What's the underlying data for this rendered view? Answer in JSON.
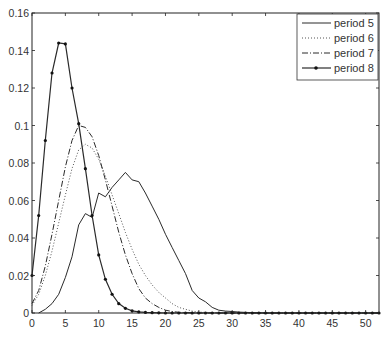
{
  "chart_data": {
    "type": "line",
    "title": "",
    "xlabel": "",
    "ylabel": "",
    "xlim": [
      0,
      52
    ],
    "ylim": [
      0,
      0.16
    ],
    "grid": false,
    "legend_position": "upper right",
    "x_ticks": [
      0,
      5,
      10,
      15,
      20,
      25,
      30,
      35,
      40,
      45,
      50
    ],
    "x_tick_labels": [
      "0",
      "5",
      "10",
      "15",
      "20",
      "25",
      "30",
      "35",
      "40",
      "45",
      "50"
    ],
    "y_ticks": [
      0,
      0.02,
      0.04,
      0.06,
      0.08,
      0.1,
      0.12,
      0.14,
      0.16
    ],
    "y_tick_labels": [
      "0",
      "0.02",
      "0.04",
      "0.06",
      "0.08",
      "0.1",
      "0.12",
      "0.14",
      "0.16"
    ],
    "series": [
      {
        "name": "period 5",
        "style": "solid",
        "markers": false,
        "x": [
          1,
          2,
          3,
          4,
          5,
          6,
          7,
          8,
          9,
          10,
          11,
          12,
          13,
          14,
          15,
          16,
          17,
          18,
          19,
          20,
          21,
          22,
          23,
          24,
          25,
          26,
          27,
          28,
          29,
          30,
          31,
          32,
          33,
          34,
          35,
          40,
          45,
          50,
          52
        ],
        "values": [
          0,
          0.002,
          0.005,
          0.01,
          0.019,
          0.03,
          0.047,
          0.053,
          0.051,
          0.064,
          0.062,
          0.067,
          0.071,
          0.075,
          0.071,
          0.07,
          0.064,
          0.057,
          0.05,
          0.042,
          0.035,
          0.028,
          0.021,
          0.012,
          0.008,
          0.006,
          0.003,
          0.0015,
          0.001,
          0.0008,
          0.0005,
          0.0003,
          0.0002,
          0.0001,
          0,
          0,
          0,
          0,
          0
        ]
      },
      {
        "name": "period 6",
        "style": "dotted",
        "markers": false,
        "x": [
          0,
          1,
          2,
          3,
          4,
          5,
          6,
          7,
          8,
          9,
          10,
          11,
          12,
          13,
          14,
          15,
          16,
          17,
          18,
          19,
          20,
          21,
          22,
          23,
          24,
          25,
          26,
          30,
          35,
          40,
          45,
          50,
          52
        ],
        "values": [
          0.004,
          0.01,
          0.02,
          0.033,
          0.048,
          0.063,
          0.077,
          0.087,
          0.09,
          0.088,
          0.082,
          0.073,
          0.063,
          0.053,
          0.043,
          0.034,
          0.026,
          0.02,
          0.015,
          0.011,
          0.008,
          0.005,
          0.003,
          0.002,
          0.001,
          0.0005,
          0.0003,
          0,
          0,
          0,
          0,
          0,
          0
        ]
      },
      {
        "name": "period 7",
        "style": "dashdot",
        "markers": false,
        "x": [
          0,
          1,
          2,
          3,
          4,
          5,
          6,
          7,
          8,
          9,
          10,
          11,
          12,
          13,
          14,
          15,
          16,
          17,
          18,
          19,
          20,
          21,
          22,
          25,
          30,
          35,
          40,
          45,
          50,
          52
        ],
        "values": [
          0.005,
          0.012,
          0.025,
          0.042,
          0.06,
          0.078,
          0.092,
          0.1,
          0.099,
          0.094,
          0.084,
          0.071,
          0.057,
          0.043,
          0.031,
          0.021,
          0.013,
          0.008,
          0.005,
          0.003,
          0.0015,
          0.0008,
          0.0004,
          0,
          0,
          0,
          0,
          0,
          0,
          0
        ]
      },
      {
        "name": "period 8",
        "style": "solid",
        "markers": true,
        "x": [
          0,
          1,
          2,
          3,
          4,
          5,
          6,
          7,
          8,
          9,
          10,
          11,
          12,
          13,
          14,
          15,
          16,
          17,
          18,
          19,
          20,
          21,
          22,
          23,
          24,
          25,
          26,
          27,
          28,
          29,
          30,
          31,
          32,
          33,
          34,
          35,
          36,
          37,
          38,
          39,
          40,
          41,
          42,
          43,
          44,
          45,
          46,
          47,
          48,
          49,
          50,
          51,
          52
        ],
        "values": [
          0.02,
          0.052,
          0.092,
          0.128,
          0.144,
          0.1435,
          0.12,
          0.101,
          0.077,
          0.052,
          0.031,
          0.018,
          0.01,
          0.005,
          0.0025,
          0.0012,
          0.0006,
          0.0003,
          0.0002,
          0.0001,
          0,
          0,
          0,
          0,
          0,
          0,
          0,
          0,
          0,
          0,
          0,
          0,
          0,
          0,
          0,
          0,
          0,
          0,
          0,
          0,
          0,
          0,
          0,
          0,
          0,
          0,
          0,
          0,
          0,
          0,
          0,
          0,
          0
        ]
      }
    ]
  },
  "legend": {
    "items": [
      {
        "label": "period 5"
      },
      {
        "label": "period 6"
      },
      {
        "label": "period 7"
      },
      {
        "label": "period 8"
      }
    ]
  },
  "colors": {
    "axis": "#222222",
    "line": "#2a2a2a",
    "background": "#ffffff"
  }
}
